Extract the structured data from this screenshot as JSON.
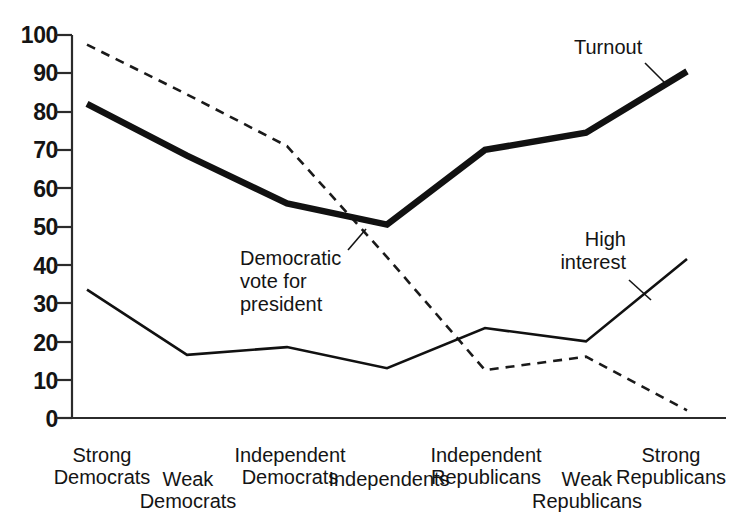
{
  "chart_data": {
    "type": "line",
    "title": "",
    "subtitle": "",
    "xlabel": "",
    "ylabel": "",
    "ylim": [
      0,
      100
    ],
    "ytick_step": 10,
    "grid": false,
    "legend_position": "inline-annotations",
    "categories": [
      "Strong\nDemocrats",
      "Weak\nDemocrats",
      "Independent\nDemocrats",
      "Independents",
      "Independent\nRepublicans",
      "Weak\nRepublicans",
      "Strong\nRepublicans"
    ],
    "yticks": [
      "0",
      "10",
      "20",
      "30",
      "40",
      "50",
      "60",
      "70",
      "80",
      "90",
      "100"
    ],
    "series": [
      {
        "name": "Turnout",
        "style": "thick-solid",
        "color": "#111111",
        "values": [
          82,
          68.5,
          56,
          50.5,
          70,
          74.5,
          90.5
        ]
      },
      {
        "name": "Democratic vote for president",
        "style": "dashed",
        "color": "#1a1a1a",
        "values": [
          97.5,
          84.5,
          71,
          42,
          12.5,
          16,
          2
        ]
      },
      {
        "name": "High interest",
        "style": "thin-solid",
        "color": "#111111",
        "values": [
          33.5,
          16.5,
          18.5,
          13,
          23.5,
          20,
          41.5
        ]
      }
    ],
    "annotations": [
      {
        "id": "turnout",
        "text": "Turnout"
      },
      {
        "id": "democratic-vote",
        "text": "Democratic\nvote for\npresident"
      },
      {
        "id": "high-interest",
        "text": "High\ninterest"
      }
    ]
  }
}
